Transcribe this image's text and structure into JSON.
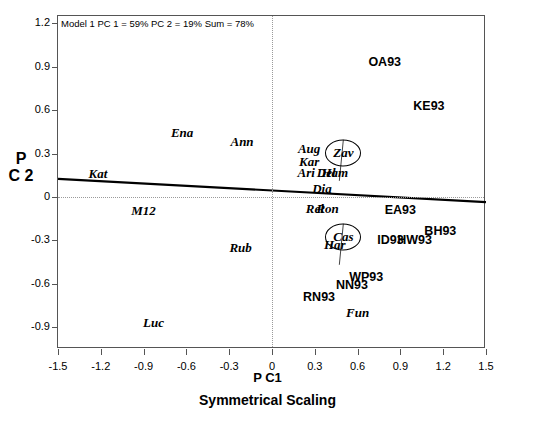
{
  "chart_data": {
    "type": "scatter",
    "title": "",
    "annotation": "Model 1 PC 1 = 59% PC 2 = 19% Sum = 78%",
    "xlabel": "P C1",
    "ylabel": "P C 2",
    "caption": "Symmetrical Scaling",
    "xlim": [
      -1.5,
      1.5
    ],
    "ylim": [
      -1.05,
      1.25
    ],
    "xticks": [
      "-1.5",
      "-1.2",
      "-0.9",
      "-0.6",
      "-0.3",
      "0",
      "0.3",
      "0.6",
      "0.9",
      "1.2",
      "1.5"
    ],
    "xtickvals": [
      -1.5,
      -1.2,
      -0.9,
      -0.6,
      -0.3,
      0,
      0.3,
      0.6,
      0.9,
      1.2,
      1.5
    ],
    "yticks": [
      "1.2",
      "0.9",
      "0.6",
      "0.3",
      "0",
      "-0.3",
      "-0.6",
      "-0.9"
    ],
    "ytickvals": [
      1.2,
      0.9,
      0.6,
      0.3,
      0,
      -0.3,
      -0.6,
      -0.9
    ],
    "grid": "dotted zero-lines only",
    "legend": "none",
    "series": [
      {
        "name": "species",
        "style": "italic-serif",
        "points": [
          {
            "label": "Ena",
            "x": -0.63,
            "y": 0.44
          },
          {
            "label": "Ann",
            "x": -0.21,
            "y": 0.38
          },
          {
            "label": "Aug",
            "x": 0.26,
            "y": 0.33
          },
          {
            "label": "Kar",
            "x": 0.26,
            "y": 0.245
          },
          {
            "label": "Zav",
            "x": 0.5,
            "y": 0.305,
            "circled": true
          },
          {
            "label": "Ari",
            "x": 0.24,
            "y": 0.165
          },
          {
            "label": "Del",
            "x": 0.38,
            "y": 0.165
          },
          {
            "label": "Ham",
            "x": 0.44,
            "y": 0.165
          },
          {
            "label": "Dia",
            "x": 0.35,
            "y": 0.055
          },
          {
            "label": "Kat",
            "x": -1.22,
            "y": 0.16
          },
          {
            "label": "M12",
            "x": -0.9,
            "y": -0.1
          },
          {
            "label": "Rel",
            "x": 0.3,
            "y": -0.085
          },
          {
            "label": "Ron",
            "x": 0.39,
            "y": -0.085
          },
          {
            "label": "Cas",
            "x": 0.5,
            "y": -0.275,
            "circled": true
          },
          {
            "label": "Har",
            "x": 0.44,
            "y": -0.335
          },
          {
            "label": "Rub",
            "x": -0.22,
            "y": -0.35
          },
          {
            "label": "Fun",
            "x": 0.6,
            "y": -0.8
          },
          {
            "label": "Luc",
            "x": -0.83,
            "y": -0.87
          }
        ]
      },
      {
        "name": "sites",
        "style": "bold-sans",
        "points": [
          {
            "label": "OA93",
            "x": 0.79,
            "y": 0.93
          },
          {
            "label": "KE93",
            "x": 1.1,
            "y": 0.63
          },
          {
            "label": "EA93",
            "x": 0.9,
            "y": -0.09
          },
          {
            "label": "BH93",
            "x": 1.18,
            "y": -0.235
          },
          {
            "label": "HW93",
            "x": 1.0,
            "y": -0.295
          },
          {
            "label": "ID93",
            "x": 0.83,
            "y": -0.3
          },
          {
            "label": "WP93",
            "x": 0.66,
            "y": -0.55
          },
          {
            "label": "NN93",
            "x": 0.56,
            "y": -0.61
          },
          {
            "label": "RN93",
            "x": 0.33,
            "y": -0.69
          }
        ]
      }
    ],
    "regression_line": {
      "x0": -1.5,
      "y0": 0.125,
      "x1": 1.5,
      "y1": -0.035
    }
  }
}
